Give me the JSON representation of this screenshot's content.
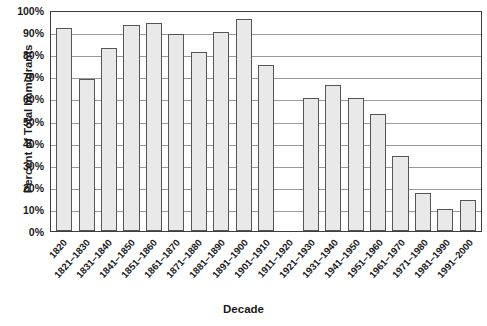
{
  "chart_data": {
    "type": "bar",
    "title": "",
    "xlabel": "Decade",
    "ylabel": "Percent of Total Immigrants",
    "ylim": [
      0,
      100
    ],
    "ytick_labels": [
      "100%",
      "90%",
      "80%",
      "70%",
      "60%",
      "50%",
      "40%",
      "30%",
      "20%",
      "10%",
      "0%"
    ],
    "ytick_values": [
      100,
      90,
      80,
      70,
      60,
      50,
      40,
      30,
      20,
      10,
      0
    ],
    "grid": true,
    "legend": "none",
    "categories": [
      "1820",
      "1821–1830",
      "1831–1840",
      "1841–1850",
      "1851–1860",
      "1861–1870",
      "1871–1880",
      "1881–1890",
      "1891–1900",
      "1901–1910",
      "1911–1920",
      "1921–1930",
      "1931–1940",
      "1941–1950",
      "1951–1960",
      "1961–1970",
      "1971–1980",
      "1981–1990",
      "1991–2000"
    ],
    "values": [
      92,
      69,
      83,
      93,
      94,
      89,
      81,
      90,
      96,
      75,
      null,
      60,
      66,
      60,
      53,
      34,
      17,
      10,
      14
    ],
    "bar_fill_color": "#e9e9e9",
    "bar_border_color": "#555555",
    "plot_border_color": "#3d3d3d",
    "gridline_color": "#9a9a9a"
  }
}
